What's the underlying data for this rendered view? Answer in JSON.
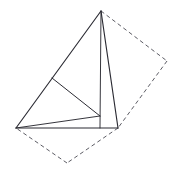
{
  "figure": {
    "type": "line-diagram",
    "background_color": "#ffffff",
    "canvas": {
      "width": 180,
      "height": 177
    },
    "stroke_color": "#2b2b33",
    "stroke_color_light": "#4a4a52",
    "stroke_width_main": 1.1,
    "stroke_width_thin": 0.9,
    "dash_pattern": "4 3",
    "vertices": {
      "apex": {
        "label": "apex",
        "x": 101,
        "y": 11
      },
      "left": {
        "label": "left-base",
        "x": 16,
        "y": 128
      },
      "right": {
        "label": "right-base",
        "x": 118,
        "y": 128
      },
      "foot": {
        "label": "altitude-foot",
        "x": 100,
        "y": 128
      },
      "interior": {
        "label": "interior-point",
        "x": 100,
        "y": 116
      },
      "midleft": {
        "label": "left-edge-point",
        "x": 52,
        "y": 78
      },
      "dash_right": {
        "label": "dashed-right",
        "x": 167,
        "y": 61
      },
      "dash_bottom": {
        "label": "dashed-bottom",
        "x": 67,
        "y": 163
      }
    },
    "solid_edges": [
      {
        "name": "apex-to-left-edge",
        "from": "apex",
        "to": "left",
        "width": 1.15
      },
      {
        "name": "left-to-right-base",
        "from": "left",
        "to": "right",
        "width": 1.15
      },
      {
        "name": "apex-to-right-base",
        "from": "apex",
        "to": "right",
        "width": 1.15
      },
      {
        "name": "apex-altitude",
        "from": "apex",
        "to": "foot",
        "width": 0.95
      },
      {
        "name": "left-to-interior",
        "from": "left",
        "to": "interior",
        "width": 0.95
      },
      {
        "name": "midleft-to-interior",
        "from": "midleft",
        "to": "interior",
        "width": 1.0
      },
      {
        "name": "midleft-to-left-short",
        "from": "midleft",
        "to": "left",
        "width": 0.0
      }
    ],
    "dashed_edges": [
      {
        "name": "apex-to-dashed-right",
        "from": "apex",
        "to": "dash_right"
      },
      {
        "name": "dashed-right-to-right-base",
        "from": "dash_right",
        "to": "right"
      },
      {
        "name": "right-base-to-dashed-bottom",
        "from": "right",
        "to": "dash_bottom"
      },
      {
        "name": "dashed-bottom-to-left-base",
        "from": "dash_bottom",
        "to": "left"
      }
    ]
  }
}
